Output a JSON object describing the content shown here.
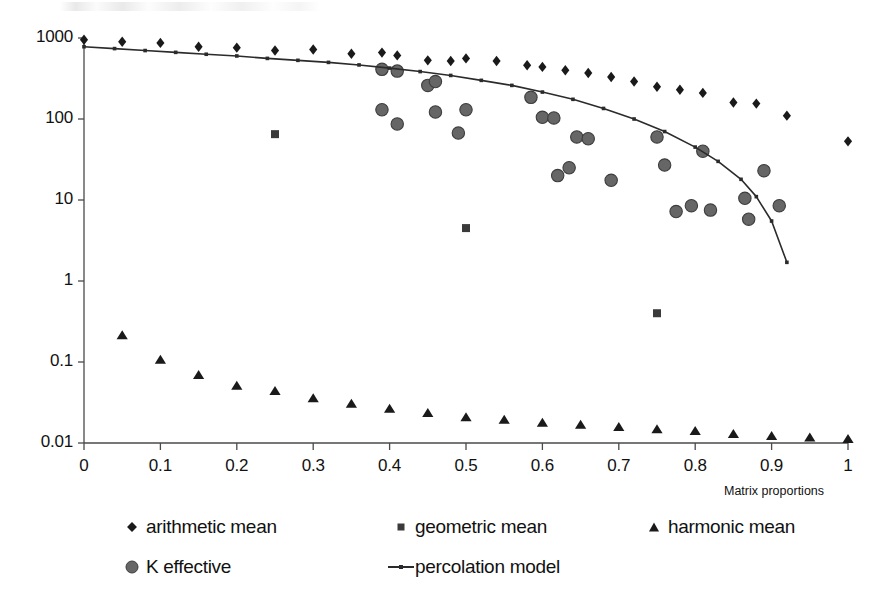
{
  "chart_data": {
    "type": "scatter",
    "title": "",
    "xlabel": "Matrix proportions",
    "ylabel": "",
    "xlim": [
      0,
      1
    ],
    "ylim": [
      0.01,
      1000
    ],
    "yscale": "log",
    "grid": false,
    "legend_position": "bottom",
    "xticks": [
      "0",
      "0.1",
      "0.2",
      "0.3",
      "0.4",
      "0.5",
      "0.6",
      "0.7",
      "0.8",
      "0.9",
      "1"
    ],
    "xtick_values": [
      0,
      0.1,
      0.2,
      0.3,
      0.4,
      0.5,
      0.6,
      0.7,
      0.8,
      0.9,
      1
    ],
    "yticks": [
      "1000",
      "100",
      "10",
      "1",
      "0.1",
      "0.01"
    ],
    "ytick_values": [
      1000,
      100,
      10,
      1,
      0.1,
      0.01
    ],
    "series": [
      {
        "name": "arithmetic mean",
        "marker": "diamond",
        "color": "#1a1a1a",
        "points": [
          [
            0.0,
            950
          ],
          [
            0.05,
            900
          ],
          [
            0.1,
            870
          ],
          [
            0.15,
            780
          ],
          [
            0.2,
            760
          ],
          [
            0.25,
            700
          ],
          [
            0.3,
            720
          ],
          [
            0.35,
            640
          ],
          [
            0.39,
            660
          ],
          [
            0.41,
            610
          ],
          [
            0.45,
            530
          ],
          [
            0.48,
            520
          ],
          [
            0.5,
            560
          ],
          [
            0.54,
            520
          ],
          [
            0.58,
            460
          ],
          [
            0.6,
            440
          ],
          [
            0.63,
            400
          ],
          [
            0.66,
            370
          ],
          [
            0.69,
            330
          ],
          [
            0.72,
            290
          ],
          [
            0.75,
            250
          ],
          [
            0.78,
            230
          ],
          [
            0.81,
            210
          ],
          [
            0.85,
            160
          ],
          [
            0.88,
            155
          ],
          [
            0.92,
            110
          ],
          [
            1.0,
            53
          ]
        ]
      },
      {
        "name": "geometric mean",
        "marker": "square",
        "color": "#3a3a3a",
        "points": [
          [
            0.25,
            65
          ],
          [
            0.5,
            4.5
          ],
          [
            0.75,
            0.4
          ]
        ]
      },
      {
        "name": "harmonic mean",
        "marker": "triangle",
        "color": "#1a1a1a",
        "points": [
          [
            0.05,
            0.21
          ],
          [
            0.1,
            0.105
          ],
          [
            0.15,
            0.068
          ],
          [
            0.2,
            0.05
          ],
          [
            0.25,
            0.043
          ],
          [
            0.3,
            0.035
          ],
          [
            0.35,
            0.03
          ],
          [
            0.4,
            0.026
          ],
          [
            0.45,
            0.023
          ],
          [
            0.5,
            0.0205
          ],
          [
            0.55,
            0.019
          ],
          [
            0.6,
            0.0175
          ],
          [
            0.65,
            0.0165
          ],
          [
            0.7,
            0.0155
          ],
          [
            0.75,
            0.0145
          ],
          [
            0.8,
            0.0138
          ],
          [
            0.85,
            0.0127
          ],
          [
            0.9,
            0.012
          ],
          [
            0.95,
            0.0115
          ],
          [
            1.0,
            0.011
          ]
        ]
      },
      {
        "name": "K effective",
        "marker": "circle",
        "color": "#666666",
        "points": [
          [
            0.39,
            410
          ],
          [
            0.39,
            130
          ],
          [
            0.41,
            390
          ],
          [
            0.41,
            87
          ],
          [
            0.45,
            260
          ],
          [
            0.46,
            122
          ],
          [
            0.46,
            290
          ],
          [
            0.49,
            67
          ],
          [
            0.5,
            130
          ],
          [
            0.585,
            185
          ],
          [
            0.6,
            105
          ],
          [
            0.615,
            103
          ],
          [
            0.62,
            20
          ],
          [
            0.635,
            25
          ],
          [
            0.645,
            60
          ],
          [
            0.66,
            57
          ],
          [
            0.69,
            17.5
          ],
          [
            0.75,
            60
          ],
          [
            0.76,
            27
          ],
          [
            0.775,
            7.2
          ],
          [
            0.795,
            8.5
          ],
          [
            0.81,
            40
          ],
          [
            0.82,
            7.5
          ],
          [
            0.865,
            10.5
          ],
          [
            0.87,
            5.8
          ],
          [
            0.89,
            23
          ],
          [
            0.91,
            8.5
          ]
        ]
      },
      {
        "name": "percolation model",
        "marker": "line",
        "color": "#2b2b2b",
        "points": [
          [
            0.0,
            780
          ],
          [
            0.04,
            740
          ],
          [
            0.08,
            700
          ],
          [
            0.12,
            665
          ],
          [
            0.16,
            630
          ],
          [
            0.2,
            600
          ],
          [
            0.24,
            560
          ],
          [
            0.28,
            530
          ],
          [
            0.32,
            500
          ],
          [
            0.36,
            465
          ],
          [
            0.4,
            425
          ],
          [
            0.44,
            385
          ],
          [
            0.48,
            345
          ],
          [
            0.52,
            300
          ],
          [
            0.56,
            260
          ],
          [
            0.6,
            215
          ],
          [
            0.64,
            175
          ],
          [
            0.68,
            135
          ],
          [
            0.72,
            100
          ],
          [
            0.76,
            70
          ],
          [
            0.8,
            45
          ],
          [
            0.83,
            30
          ],
          [
            0.86,
            18
          ],
          [
            0.88,
            11
          ],
          [
            0.9,
            5.5
          ],
          [
            0.92,
            1.7
          ]
        ]
      }
    ]
  },
  "legend": {
    "items": [
      {
        "label": "arithmetic mean",
        "marker": "diamond"
      },
      {
        "label": "geometric mean",
        "marker": "square"
      },
      {
        "label": "harmonic mean",
        "marker": "triangle"
      },
      {
        "label": "K effective",
        "marker": "circle"
      },
      {
        "label": "percolation model",
        "marker": "line"
      }
    ]
  }
}
